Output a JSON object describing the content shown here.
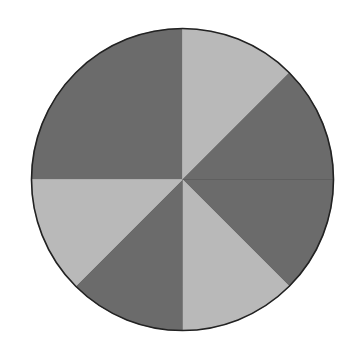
{
  "diagram": {
    "title": "",
    "colors": {
      "dark": "#6b6b6b",
      "light": "#b9b9b9",
      "outline": "#222222",
      "background": "#ffffff"
    },
    "sectors": [
      {
        "id": "top-left-quarter",
        "start_deg": 180,
        "end_deg": 270,
        "shade": "dark"
      },
      {
        "id": "top-right-upper",
        "start_deg": 270,
        "end_deg": 315,
        "shade": "light"
      },
      {
        "id": "right-upper",
        "start_deg": 315,
        "end_deg": 360,
        "shade": "dark"
      },
      {
        "id": "right-lower",
        "start_deg": 0,
        "end_deg": 45,
        "shade": "dark"
      },
      {
        "id": "bottom-right",
        "start_deg": 45,
        "end_deg": 90,
        "shade": "light"
      },
      {
        "id": "bottom-left",
        "start_deg": 90,
        "end_deg": 135,
        "shade": "dark"
      },
      {
        "id": "left-lower",
        "start_deg": 135,
        "end_deg": 180,
        "shade": "light"
      }
    ]
  }
}
